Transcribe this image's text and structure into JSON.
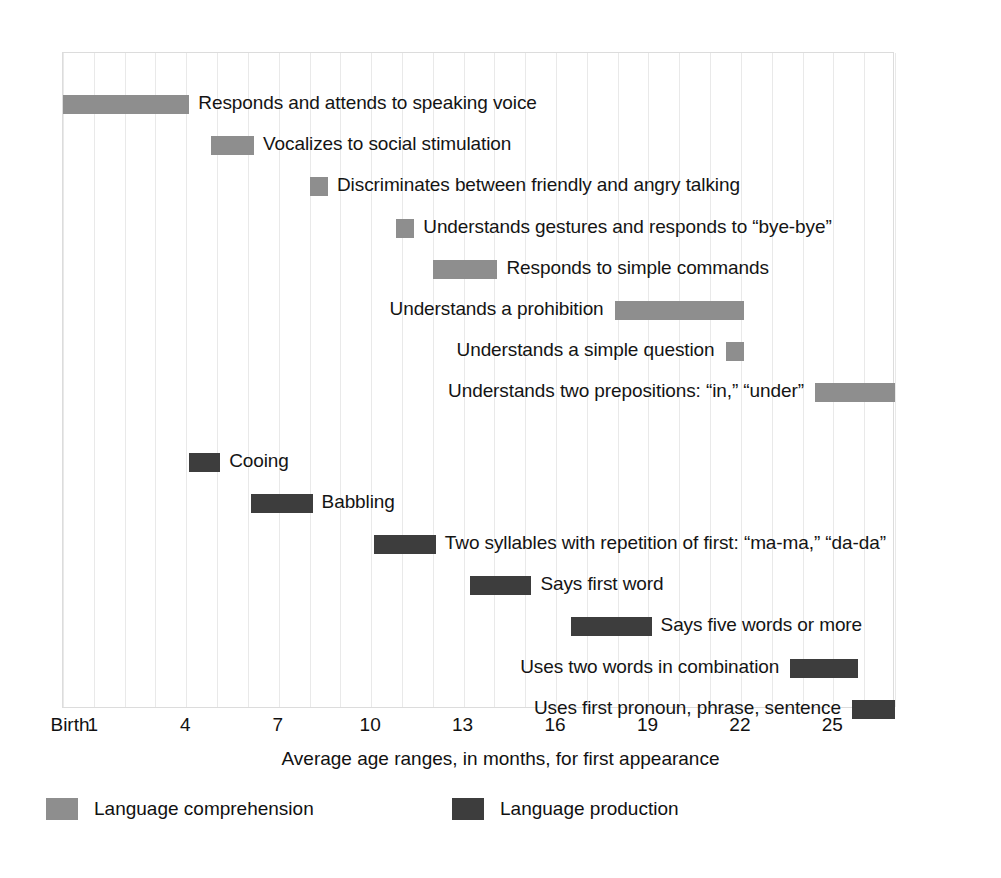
{
  "chart_data": {
    "type": "bar",
    "orientation": "horizontal",
    "subtype": "range-bar (gantt-style age ranges)",
    "title": "",
    "xlabel": "Average age ranges, in months, for first appearance",
    "ylabel": "",
    "xlim": [
      0,
      27
    ],
    "xticks": [
      0,
      1,
      4,
      7,
      10,
      13,
      16,
      19,
      22,
      25
    ],
    "xticklabels": [
      "Birth",
      "1",
      "4",
      "7",
      "10",
      "13",
      "16",
      "19",
      "22",
      "25"
    ],
    "grid": true,
    "grid_interval_months": 1,
    "legend_position": "bottom",
    "series": [
      {
        "name": "Language comprehension",
        "color": "#8e8e8e",
        "items": [
          {
            "label": "Responds and attends to speaking voice",
            "start": 0,
            "end": 4.1,
            "label_side": "right"
          },
          {
            "label": "Vocalizes to social stimulation",
            "start": 4.8,
            "end": 6.2,
            "label_side": "right"
          },
          {
            "label": "Discriminates between friendly and angry talking",
            "start": 8.0,
            "end": 8.6,
            "label_side": "right"
          },
          {
            "label": "Understands gestures and responds to “bye-bye”",
            "start": 10.8,
            "end": 11.4,
            "label_side": "right"
          },
          {
            "label": "Responds to simple commands",
            "start": 12.0,
            "end": 14.1,
            "label_side": "right"
          },
          {
            "label": "Understands a prohibition",
            "start": 17.9,
            "end": 22.1,
            "label_side": "left"
          },
          {
            "label": "Understands a simple question",
            "start": 21.5,
            "end": 22.1,
            "label_side": "left"
          },
          {
            "label": "Understands two prepositions: “in,” “under”",
            "start": 24.4,
            "end": 27.0,
            "label_side": "left"
          }
        ]
      },
      {
        "name": "Language production",
        "color": "#3d3d3d",
        "items": [
          {
            "label": "Cooing",
            "start": 4.1,
            "end": 5.1,
            "label_side": "right"
          },
          {
            "label": "Babbling",
            "start": 6.1,
            "end": 8.1,
            "label_side": "right"
          },
          {
            "label": "Two syllables with repetition of first: “ma-ma,” “da-da”",
            "start": 10.1,
            "end": 12.1,
            "label_side": "right"
          },
          {
            "label": "Says first word",
            "start": 13.2,
            "end": 15.2,
            "label_side": "right"
          },
          {
            "label": "Says five words or more",
            "start": 16.5,
            "end": 19.1,
            "label_side": "right"
          },
          {
            "label": "Uses two words in combination",
            "start": 23.6,
            "end": 25.8,
            "label_side": "left"
          },
          {
            "label": "Uses first pronoun, phrase, sentence",
            "start": 25.6,
            "end": 27.0,
            "label_side": "left"
          }
        ]
      }
    ]
  },
  "axis": {
    "title": "Average age ranges, in months, for first appearance",
    "ticks": [
      {
        "value": 0,
        "label": "Birth"
      },
      {
        "value": 1,
        "label": "1"
      },
      {
        "value": 4,
        "label": "4"
      },
      {
        "value": 7,
        "label": "7"
      },
      {
        "value": 10,
        "label": "10"
      },
      {
        "value": 13,
        "label": "13"
      },
      {
        "value": 16,
        "label": "16"
      },
      {
        "value": 19,
        "label": "19"
      },
      {
        "value": 22,
        "label": "22"
      },
      {
        "value": 25,
        "label": "25"
      }
    ]
  },
  "legend": {
    "items": [
      {
        "label": "Language comprehension",
        "color": "#8e8e8e",
        "key": "comp"
      },
      {
        "label": "Language production",
        "color": "#3d3d3d",
        "key": "prod"
      }
    ]
  },
  "colors": {
    "comprehension": "#8e8e8e",
    "production": "#3d3d3d",
    "gridline": "#e9e9e9",
    "frame": "#dcdcdc",
    "text": "#111111",
    "background": "#ffffff"
  }
}
